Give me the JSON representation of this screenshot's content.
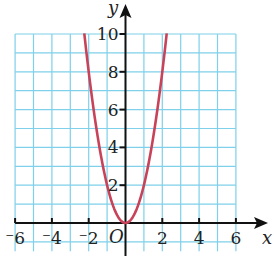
{
  "chart_data": {
    "type": "line",
    "title": "",
    "xlabel": "x",
    "ylabel": "y",
    "origin_label": "O",
    "xlim": [
      -6,
      6
    ],
    "ylim": [
      0,
      10
    ],
    "grid": true,
    "x_ticks": [
      -6,
      -4,
      -2,
      2,
      4,
      6
    ],
    "x_tick_labels": [
      "⁻6",
      "⁻4",
      "⁻2",
      "2",
      "4",
      "6"
    ],
    "y_ticks": [
      2,
      4,
      6,
      8,
      10
    ],
    "y_tick_labels": [
      "2",
      "4",
      "6",
      "8",
      "10"
    ],
    "series": [
      {
        "name": "y = 2x²",
        "color": "#c8435a",
        "x": [
          -2.24,
          -2,
          -1.5,
          -1,
          -0.5,
          0,
          0.5,
          1,
          1.5,
          2,
          2.24
        ],
        "y": [
          10,
          8,
          4.5,
          2,
          0.5,
          0,
          0.5,
          2,
          4.5,
          8,
          10
        ]
      }
    ]
  },
  "colors": {
    "grid": "#7fd0ea",
    "axis": "#111111",
    "curve": "#c8435a"
  }
}
